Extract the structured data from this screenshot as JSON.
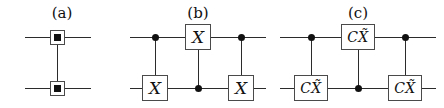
{
  "figure": {
    "width": 444,
    "height": 108,
    "background_color": "#ffffff",
    "line_color": "#2b2b2b",
    "ink_color": "#111111",
    "box_border_color": "#4a4a4a"
  },
  "panels": [
    {
      "id": "a",
      "label": "(a)",
      "description": "SWAP gate drawn as two boxed filled-square markers joined by a vertical link",
      "num_wires": 2,
      "gates": [
        {
          "name": "swap-marker-top",
          "symbol": "filled-square-in-box",
          "wire": 0,
          "column": 0
        },
        {
          "name": "swap-marker-bottom",
          "symbol": "filled-square-in-box",
          "wire": 1,
          "column": 0
        }
      ],
      "links": [
        {
          "from_wire": 0,
          "to_wire": 1,
          "column": 0
        }
      ]
    },
    {
      "id": "b",
      "label": "(b)",
      "description": "SWAP decomposed into three alternating CNOT gates",
      "num_wires": 2,
      "gates": [
        {
          "name": "control-dot-1",
          "symbol": "control-dot",
          "wire": 0,
          "column": 0
        },
        {
          "name": "target-x-1",
          "symbol": "X",
          "label": "X",
          "wire": 1,
          "column": 0
        },
        {
          "name": "target-x-2",
          "symbol": "X",
          "label": "X",
          "wire": 0,
          "column": 1
        },
        {
          "name": "control-dot-2",
          "symbol": "control-dot",
          "wire": 1,
          "column": 1
        },
        {
          "name": "control-dot-3",
          "symbol": "control-dot",
          "wire": 0,
          "column": 2
        },
        {
          "name": "target-x-3",
          "symbol": "X",
          "label": "X",
          "wire": 1,
          "column": 2
        }
      ],
      "links": [
        {
          "from_wire": 0,
          "to_wire": 1,
          "column": 0
        },
        {
          "from_wire": 0,
          "to_wire": 1,
          "column": 1
        },
        {
          "from_wire": 0,
          "to_wire": 1,
          "column": 2
        }
      ]
    },
    {
      "id": "c",
      "label": "(c)",
      "description": "Same three-gate decomposition with CX-tilde gates replacing the X gates",
      "num_wires": 2,
      "gate_label_c": "C",
      "gate_label_x": "X",
      "gate_label_accent": "tilde",
      "gates": [
        {
          "name": "control-dot-1",
          "symbol": "control-dot",
          "wire": 0,
          "column": 0
        },
        {
          "name": "target-cx-1",
          "symbol": "CXtilde",
          "label": "CX̃",
          "wire": 1,
          "column": 0
        },
        {
          "name": "target-cx-2",
          "symbol": "CXtilde",
          "label": "CX̃",
          "wire": 0,
          "column": 1
        },
        {
          "name": "control-dot-2",
          "symbol": "control-dot",
          "wire": 1,
          "column": 1
        },
        {
          "name": "control-dot-3",
          "symbol": "control-dot",
          "wire": 0,
          "column": 2
        },
        {
          "name": "target-cx-3",
          "symbol": "CXtilde",
          "label": "CX̃",
          "wire": 1,
          "column": 2
        }
      ],
      "links": [
        {
          "from_wire": 0,
          "to_wire": 1,
          "column": 0
        },
        {
          "from_wire": 0,
          "to_wire": 1,
          "column": 1
        },
        {
          "from_wire": 0,
          "to_wire": 1,
          "column": 2
        }
      ]
    }
  ]
}
